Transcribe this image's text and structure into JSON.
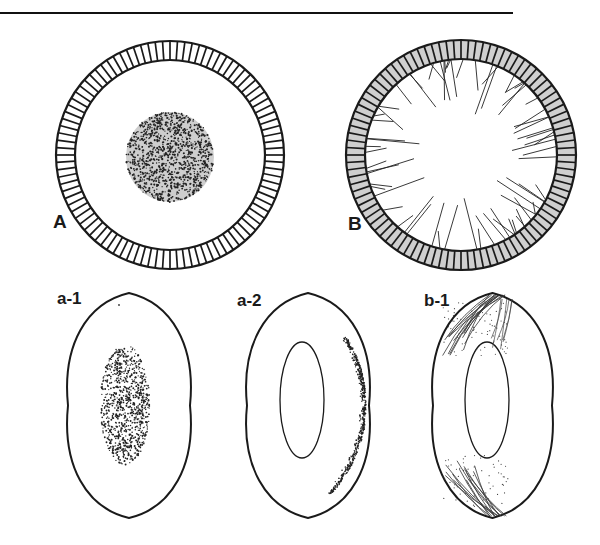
{
  "figure": {
    "rule": {
      "x1": 0,
      "x2": 513,
      "y": 13,
      "color": "#111111"
    },
    "stroke_color": "#1a1a1a",
    "ring_gray": "#cfcfcf",
    "nucleus_gray": "#bdbdbd",
    "panels": [
      {
        "id": "A",
        "label": "A",
        "label_pos": [
          53,
          212
        ],
        "type": "cell-circle",
        "center": [
          170,
          155
        ],
        "outer_r": 114,
        "ring_thickness": 19,
        "ring_fill": "#ffffff",
        "tick_count": 96,
        "nucleus": {
          "cx": 170,
          "cy": 157,
          "rx": 44,
          "ry": 45
        }
      },
      {
        "id": "B",
        "label": "B",
        "label_pos": [
          348,
          214
        ],
        "type": "cell-circle-spiked",
        "center": [
          461,
          155
        ],
        "outer_r": 115,
        "ring_thickness": 19,
        "ring_fill": "#cfcfcf",
        "tick_count": 96,
        "spike_count": 70
      },
      {
        "id": "a-1",
        "label": "a-1",
        "label_pos": [
          57,
          290
        ],
        "type": "lens-speckle",
        "bbox": [
          68,
          293,
          190,
          518
        ],
        "speckle": {
          "cx": 125,
          "cy": 405,
          "rx": 25,
          "ry": 60
        }
      },
      {
        "id": "a-2",
        "label": "a-2",
        "label_pos": [
          237,
          292
        ],
        "type": "lens-rim-speckle",
        "bbox": [
          247,
          293,
          369,
          518
        ],
        "inner": {
          "cx": 302,
          "cy": 400,
          "rx": 22,
          "ry": 58
        }
      },
      {
        "id": "b-1",
        "label": "b-1",
        "label_pos": [
          424,
          292
        ],
        "type": "lens-fibers",
        "bbox": [
          433,
          293,
          552,
          518
        ],
        "inner": {
          "cx": 487,
          "cy": 400,
          "rx": 22,
          "ry": 58
        }
      }
    ]
  }
}
